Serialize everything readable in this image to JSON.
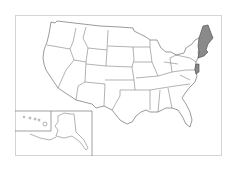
{
  "map": {
    "type": "US states outline map",
    "highlight_color": "#8a8a8a",
    "border_color": "#d4d4d4",
    "highlighted_states": [
      "Maine",
      "New Hampshire",
      "Vermont",
      "Massachusetts",
      "Rhode Island",
      "Connecticut",
      "New Jersey"
    ],
    "insets": [
      "Alaska",
      "Hawaii"
    ]
  }
}
